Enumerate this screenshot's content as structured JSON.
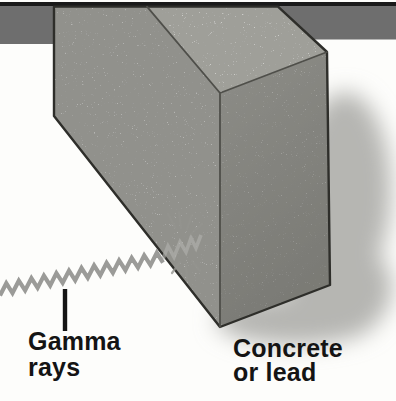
{
  "figure": {
    "labels": {
      "gamma": {
        "line1": "Gamma",
        "line2": "rays"
      },
      "material": {
        "line1": "Concrete",
        "line2": "or lead"
      }
    },
    "colors": {
      "background": "#fdfdfb",
      "top_line": "#1a1a1a",
      "bar": "#6e6e6e",
      "front_face": "#b5b5b2",
      "top_face": "#cdcdc9",
      "right_face_top": "#aeaeaa",
      "right_face_bottom": "#8f8f8b",
      "shadow": "#b6b6b2",
      "speckle": "#5e5e5a",
      "wave": "#9b9b98",
      "wave_absorbed": "#b3b3af",
      "burst": "#94948f",
      "text": "#141414"
    }
  }
}
